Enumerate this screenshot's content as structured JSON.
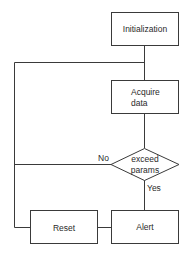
{
  "diagram": {
    "type": "flowchart",
    "colors": {
      "stroke": "#3a3a3a",
      "text": "#2a2a2a",
      "background": "#ffffff"
    },
    "nodes": {
      "initialization": {
        "label": "Initialization",
        "shape": "rectangle"
      },
      "acquire": {
        "line1": "Acquire",
        "line2": "data",
        "shape": "rectangle"
      },
      "decision": {
        "line1": "exceed",
        "line2": "params",
        "shape": "diamond"
      },
      "reset": {
        "label": "Reset",
        "shape": "rectangle"
      },
      "alert": {
        "label": "Alert",
        "shape": "rectangle"
      }
    },
    "edge_labels": {
      "no": "No",
      "yes": "Yes"
    },
    "edges": [
      {
        "from": "initialization",
        "to": "acquire"
      },
      {
        "from": "acquire",
        "to": "decision"
      },
      {
        "from": "decision",
        "to": "acquire",
        "label": "No"
      },
      {
        "from": "decision",
        "to": "alert",
        "label": "Yes"
      },
      {
        "from": "alert",
        "to": "reset"
      },
      {
        "from": "reset",
        "to": "acquire"
      }
    ]
  }
}
